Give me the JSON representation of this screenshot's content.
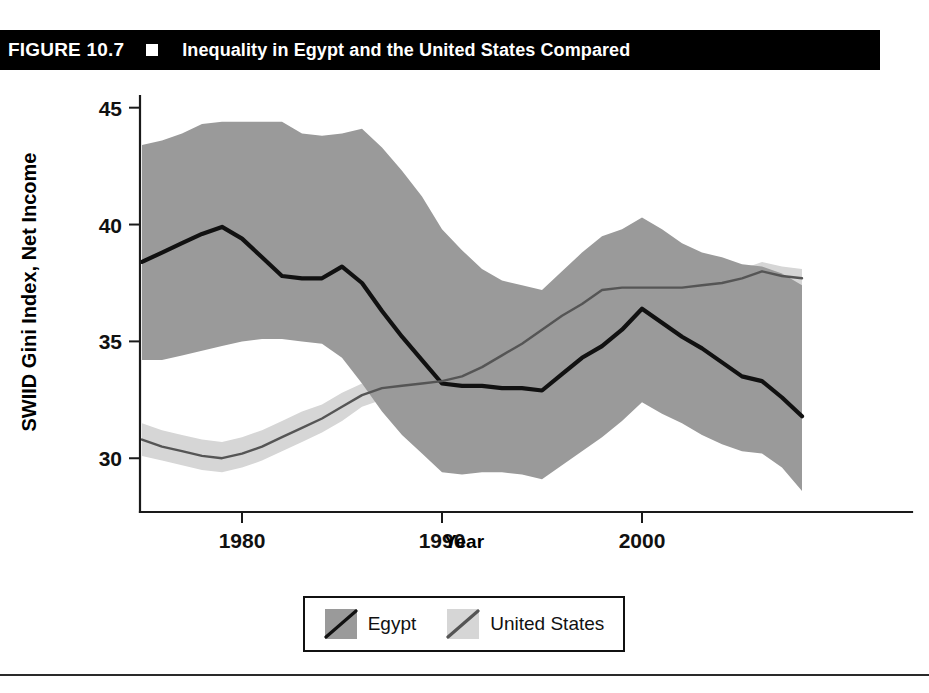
{
  "figure": {
    "number": "FIGURE 10.7",
    "bullet_icon": "square-bullet-icon",
    "title": "Inequality in Egypt and the United States Compared"
  },
  "legend": {
    "entries": [
      {
        "label": "Egypt",
        "band_color": "#9a9a9a",
        "line_color": "#111111"
      },
      {
        "label": "United States",
        "band_color": "#d6d6d6",
        "line_color": "#555555"
      }
    ]
  },
  "chart_data": {
    "type": "line",
    "title": "Inequality in Egypt and the United States Compared",
    "xlabel": "Year",
    "ylabel": "SWIID Gini Index, Net Income",
    "xlim": [
      1975,
      2009
    ],
    "ylim": [
      27.7,
      45.5
    ],
    "xticks": [
      "1980",
      "1990",
      "2000"
    ],
    "xtick_values": [
      1980,
      1990,
      2000
    ],
    "yticks": [
      "30",
      "35",
      "40",
      "45"
    ],
    "ytick_values": [
      30,
      35,
      40,
      45
    ],
    "grid": false,
    "legend_position": "below-center",
    "x": [
      1975,
      1976,
      1977,
      1978,
      1979,
      1980,
      1981,
      1982,
      1983,
      1984,
      1985,
      1986,
      1987,
      1988,
      1989,
      1990,
      1991,
      1992,
      1993,
      1994,
      1995,
      1996,
      1997,
      1998,
      1999,
      2000,
      2001,
      2002,
      2003,
      2004,
      2005,
      2006,
      2007,
      2008
    ],
    "series": [
      {
        "name": "Egypt",
        "line_color": "#111111",
        "band_color": "#9a9a9a",
        "values": [
          38.4,
          38.8,
          39.2,
          39.6,
          39.9,
          39.4,
          38.6,
          37.8,
          37.7,
          37.7,
          38.2,
          37.5,
          36.3,
          35.2,
          34.2,
          33.2,
          33.1,
          33.1,
          33.0,
          33.0,
          32.9,
          33.6,
          34.3,
          34.8,
          35.5,
          36.4,
          35.8,
          35.2,
          34.7,
          34.1,
          33.5,
          33.3,
          32.6,
          31.8
        ],
        "band_upper": [
          43.4,
          43.6,
          43.9,
          44.3,
          44.4,
          44.4,
          44.4,
          44.4,
          43.9,
          43.8,
          43.9,
          44.1,
          43.3,
          42.3,
          41.2,
          39.8,
          38.9,
          38.1,
          37.6,
          37.4,
          37.2,
          38.0,
          38.8,
          39.5,
          39.8,
          40.3,
          39.8,
          39.2,
          38.8,
          38.6,
          38.3,
          38.2,
          37.9,
          37.4
        ],
        "band_lower": [
          34.2,
          34.2,
          34.4,
          34.6,
          34.8,
          35.0,
          35.1,
          35.1,
          35.0,
          34.9,
          34.3,
          33.2,
          32.0,
          31.0,
          30.2,
          29.4,
          29.3,
          29.4,
          29.4,
          29.3,
          29.1,
          29.7,
          30.3,
          30.9,
          31.6,
          32.4,
          31.9,
          31.5,
          31.0,
          30.6,
          30.3,
          30.2,
          29.6,
          28.6
        ]
      },
      {
        "name": "United States",
        "line_color": "#555555",
        "band_color": "#d6d6d6",
        "values": [
          30.8,
          30.5,
          30.3,
          30.1,
          30.0,
          30.2,
          30.5,
          30.9,
          31.3,
          31.7,
          32.2,
          32.7,
          33.0,
          33.1,
          33.2,
          33.3,
          33.5,
          33.9,
          34.4,
          34.9,
          35.5,
          36.1,
          36.6,
          37.2,
          37.3,
          37.3,
          37.3,
          37.3,
          37.4,
          37.5,
          37.7,
          38.0,
          37.8,
          37.7
        ],
        "band_upper": [
          31.5,
          31.2,
          31.0,
          30.8,
          30.7,
          30.9,
          31.2,
          31.6,
          32.0,
          32.3,
          32.8,
          33.2,
          33.5,
          33.6,
          33.7,
          33.8,
          34.0,
          34.4,
          34.9,
          35.4,
          36.0,
          36.6,
          37.1,
          37.6,
          37.7,
          37.7,
          37.7,
          37.7,
          37.8,
          37.9,
          38.1,
          38.4,
          38.2,
          38.1
        ],
        "band_lower": [
          30.1,
          29.9,
          29.7,
          29.5,
          29.4,
          29.6,
          29.9,
          30.3,
          30.7,
          31.1,
          31.6,
          32.2,
          32.5,
          32.6,
          32.7,
          32.8,
          33.0,
          33.4,
          33.9,
          34.4,
          35.0,
          35.6,
          36.1,
          36.7,
          36.9,
          36.9,
          36.9,
          36.9,
          37.0,
          37.1,
          37.3,
          37.6,
          37.4,
          37.3
        ]
      }
    ]
  }
}
